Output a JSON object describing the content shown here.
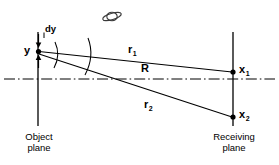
{
  "figure": {
    "kind": "optical-geometry-diagram",
    "width": 279,
    "height": 165,
    "background_color": "#ffffff",
    "line_color": "#000000"
  },
  "labels": {
    "source_point": "y",
    "source_extent": "dy",
    "distance_axis": "R",
    "ray_upper_base": "r",
    "ray_upper_sub": "1",
    "ray_lower_base": "r",
    "ray_lower_sub": "2",
    "point_upper_base": "x",
    "point_upper_sub": "1",
    "point_lower_base": "x",
    "point_lower_sub": "2",
    "left_plane": "Object\nplane",
    "right_plane": "Receiving\nplane"
  },
  "icons": {
    "planet": "saturn-planet-icon",
    "arrow_down": "arrow-down-icon",
    "arrow_up": "arrow-up-icon"
  },
  "geometry": {
    "object_plane_x": 38,
    "receiving_plane_x": 233,
    "axis_y": 79,
    "source_y": 51,
    "point_x1_y": 72,
    "point_x2_y": 117
  }
}
